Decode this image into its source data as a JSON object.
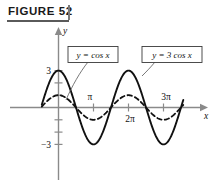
{
  "figure": {
    "caption": "FIGURE 52"
  },
  "axes": {
    "x_axis_label": "x",
    "y_axis_label": "y",
    "x_ticks": [
      {
        "label": "π",
        "value": 3.14159,
        "position": "above"
      },
      {
        "label": "2π",
        "value": 6.28319,
        "position": "below"
      },
      {
        "label": "3π",
        "value": 9.42478,
        "position": "above"
      }
    ],
    "y_ticks": [
      {
        "label": "3",
        "value": 3
      },
      {
        "label": "−3",
        "value": -3
      }
    ],
    "xlim": [
      -1.5,
      11.2
    ],
    "ylim": [
      -4.2,
      4.2
    ],
    "grid": false
  },
  "annotations": [
    {
      "text": "y = cos x",
      "target_curve": "cos-x"
    },
    {
      "text": "y = 3 cos x",
      "target_curve": "3cos-x"
    }
  ],
  "chart_data": {
    "type": "line",
    "title": "FIGURE 52",
    "xlabel": "x",
    "ylabel": "y",
    "xlim": [
      -1.5,
      11.2
    ],
    "ylim": [
      -4.2,
      4.2
    ],
    "grid": false,
    "legend": "inline-boxed-callouts",
    "x_tick_labels": [
      "π",
      "2π",
      "3π"
    ],
    "x_tick_values": [
      3.14159,
      6.28319,
      9.42478
    ],
    "y_tick_labels": [
      "3",
      "−3"
    ],
    "y_tick_values": [
      3,
      -3
    ],
    "series": [
      {
        "name": "y = cos x",
        "style": "dashed",
        "color": "#111111",
        "amplitude": 1,
        "function": "cos(x)",
        "x": [
          -1.5,
          -1.0,
          -0.5,
          0.0,
          0.5,
          1.0,
          1.5708,
          2.0,
          2.5,
          3.14159,
          3.8,
          4.3,
          4.7124,
          5.2,
          5.8,
          6.28319,
          6.9,
          7.5,
          7.854,
          8.4,
          9.0,
          9.42478,
          10.0,
          10.6,
          11.2
        ],
        "values": [
          0.0707,
          0.5403,
          0.8776,
          1.0,
          0.8776,
          0.5403,
          0.0,
          -0.4161,
          -0.8011,
          -1.0,
          -0.7909,
          -0.4008,
          0.0,
          0.4685,
          0.8855,
          1.0,
          0.8011,
          0.3466,
          0.0,
          -0.5748,
          -0.9111,
          -1.0,
          -0.8391,
          -0.4008,
          0.0707
        ]
      },
      {
        "name": "y = 3 cos x",
        "style": "solid",
        "color": "#111111",
        "amplitude": 3,
        "function": "3*cos(x)",
        "x": [
          -1.5,
          -1.0,
          -0.5,
          0.0,
          0.5,
          1.0,
          1.5708,
          2.0,
          2.5,
          3.14159,
          3.8,
          4.3,
          4.7124,
          5.2,
          5.8,
          6.28319,
          6.9,
          7.5,
          7.854,
          8.4,
          9.0,
          9.42478,
          10.0,
          10.6,
          11.2
        ],
        "values": [
          0.2121,
          1.6209,
          2.6327,
          3.0,
          2.6327,
          1.6209,
          0.0,
          -1.2484,
          -2.4033,
          -3.0,
          -2.3728,
          -1.2024,
          0.0,
          1.4055,
          2.6565,
          3.0,
          2.4033,
          1.0398,
          0.0,
          -1.7243,
          -2.7333,
          -3.0,
          -2.5174,
          -1.2024,
          0.2121
        ]
      }
    ]
  },
  "colors": {
    "axis": "#8a8a8a",
    "curve": "#111111",
    "caption_rule": "#5a5a5a",
    "box_border": "#3a3a3a",
    "leader": "#555555"
  }
}
